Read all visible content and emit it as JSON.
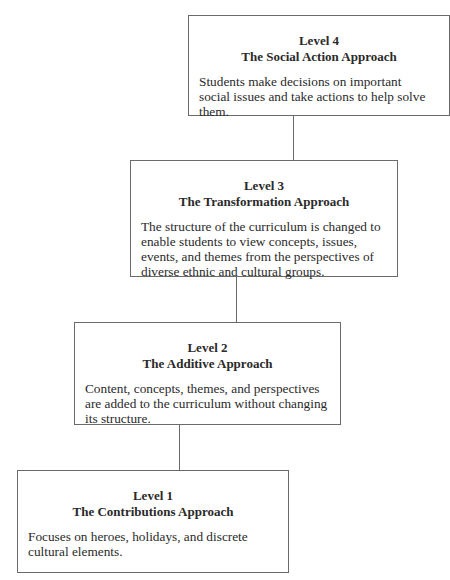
{
  "levels": [
    {
      "level": "Level 4",
      "title": "The Social Action Approach",
      "description": "Students make decisions on important social issues and take actions to help solve them."
    },
    {
      "level": "Level 3",
      "title": "The Transformation Approach",
      "description": "The structure of the curriculum is changed to enable students to view concepts, issues, events, and themes from the perspectives of diverse ethnic and cultural groups."
    },
    {
      "level": "Level 2",
      "title": "The Additive Approach",
      "description": "Content, concepts, themes, and perspectives are added to the curriculum without changing its structure."
    },
    {
      "level": "Level 1",
      "title": "The Contributions Approach",
      "description": "Focuses on heroes, holidays, and discrete cultural elements."
    }
  ],
  "colors": {
    "border": "#6a6a6a",
    "text": "#2a2a2a",
    "background": "#ffffff"
  }
}
